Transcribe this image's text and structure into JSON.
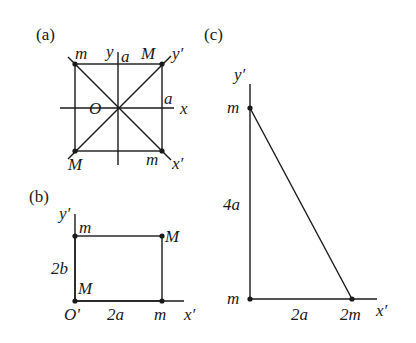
{
  "panels": {
    "a": {
      "label": "(a)",
      "origin": "O",
      "axis_x": "x",
      "axis_y": "y",
      "axis_x_prime": "x′",
      "axis_y_prime": "y′",
      "half_side_x": "a",
      "half_side_y": "a",
      "masses": {
        "top_left": "m",
        "top_right": "M",
        "bottom_left": "M",
        "bottom_right": "m"
      }
    },
    "b": {
      "label": "(b)",
      "origin": "O'",
      "axis_x_prime": "x′",
      "axis_y_prime": "y′",
      "height": "2b",
      "width": "2a",
      "masses": {
        "top_left": "m",
        "top_right": "M",
        "bottom_left": "M",
        "bottom_right": "m"
      }
    },
    "c": {
      "label": "(c)",
      "axis_x_prime": "x′",
      "axis_y_prime": "y′",
      "height": "4a",
      "width": "2a",
      "masses": {
        "top": "m",
        "origin": "m",
        "right": "2m"
      }
    }
  }
}
